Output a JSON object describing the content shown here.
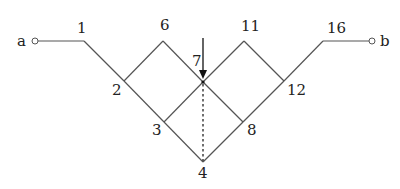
{
  "diagram": {
    "terminals": {
      "left": {
        "label": "a"
      },
      "right": {
        "label": "b"
      }
    },
    "nodes": [
      {
        "id": "1",
        "label": "1"
      },
      {
        "id": "2",
        "label": "2"
      },
      {
        "id": "3",
        "label": "3"
      },
      {
        "id": "4",
        "label": "4"
      },
      {
        "id": "6",
        "label": "6"
      },
      {
        "id": "7",
        "label": "7"
      },
      {
        "id": "8",
        "label": "8"
      },
      {
        "id": "11",
        "label": "11"
      },
      {
        "id": "12",
        "label": "12"
      },
      {
        "id": "16",
        "label": "16"
      }
    ],
    "edges": [
      [
        "a",
        "1"
      ],
      [
        "1",
        "2"
      ],
      [
        "2",
        "3"
      ],
      [
        "3",
        "4"
      ],
      [
        "2",
        "6"
      ],
      [
        "6",
        "7"
      ],
      [
        "7",
        "8"
      ],
      [
        "3",
        "7"
      ],
      [
        "7",
        "11"
      ],
      [
        "11",
        "12"
      ],
      [
        "4",
        "8"
      ],
      [
        "8",
        "12"
      ],
      [
        "12",
        "16"
      ],
      [
        "16",
        "b"
      ]
    ],
    "dashed_edges": [
      [
        "7",
        "4"
      ]
    ],
    "arrow": {
      "target": "7",
      "direction": "down"
    },
    "colors": {
      "line": "#555555",
      "text": "#222222",
      "background": "#ffffff"
    }
  }
}
